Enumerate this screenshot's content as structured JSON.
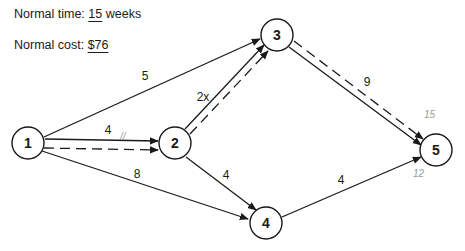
{
  "info": {
    "time_label": "Normal time:",
    "time_value": "15",
    "time_unit": "weeks",
    "cost_label": "Normal cost:",
    "cost_value": "$76"
  },
  "nodes": [
    {
      "id": "1",
      "label": "1",
      "x": 28,
      "y": 143
    },
    {
      "id": "2",
      "label": "2",
      "x": 175,
      "y": 143
    },
    {
      "id": "3",
      "label": "3",
      "x": 277,
      "y": 35
    },
    {
      "id": "4",
      "label": "4",
      "x": 266,
      "y": 223
    },
    {
      "id": "5",
      "label": "5",
      "x": 436,
      "y": 150
    }
  ],
  "edges": [
    {
      "from": "1",
      "to": "3",
      "duration": "5"
    },
    {
      "from": "1",
      "to": "2",
      "duration": "4"
    },
    {
      "from": "1",
      "to": "4",
      "duration": "8"
    },
    {
      "from": "2",
      "to": "3",
      "duration": "2x"
    },
    {
      "from": "2",
      "to": "4",
      "duration": "4"
    },
    {
      "from": "3",
      "to": "5",
      "duration": "9"
    },
    {
      "from": "4",
      "to": "5",
      "duration": "4"
    }
  ],
  "critical_path": [
    "1",
    "2",
    "3",
    "5"
  ],
  "annotations": {
    "near_node5_top": "15",
    "near_node5_bottom": "12",
    "tick_1_2": "//"
  }
}
